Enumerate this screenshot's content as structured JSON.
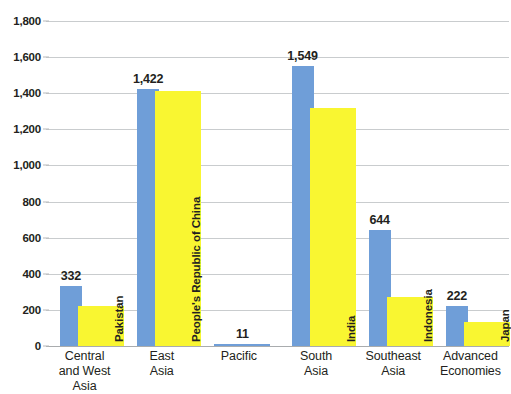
{
  "chart_data": {
    "type": "bar",
    "title": "",
    "subtitle": "",
    "xlabel": "",
    "ylabel": "",
    "ylim": [
      0,
      1800
    ],
    "ytick_step": 200,
    "ytick_labels": [
      "1,800",
      "1,600",
      "1,400",
      "1,200",
      "1,000",
      "800",
      "600",
      "400",
      "200",
      "0"
    ],
    "ytick_values": [
      1800,
      1600,
      1400,
      1200,
      1000,
      800,
      600,
      400,
      200,
      0
    ],
    "grid": true,
    "legend": "none",
    "bar_style": "overlapped",
    "categories": [
      "Central and West Asia",
      "East Asia",
      "Pacific",
      "South Asia",
      "Southeast Asia",
      "Advanced Economies"
    ],
    "category_label_lines": [
      [
        "Central",
        "and West",
        "Asia"
      ],
      [
        "East",
        "Asia"
      ],
      [
        "Pacific"
      ],
      [
        "South",
        "Asia"
      ],
      [
        "Southeast",
        "Asia"
      ],
      [
        "Advanced",
        "Economies"
      ]
    ],
    "series": [
      {
        "name": "Region total",
        "color": "#6f9ed8",
        "values": [
          332,
          1422,
          11,
          1549,
          644,
          222
        ],
        "value_labels": [
          "332",
          "1,422",
          "11",
          "1,549",
          "644",
          "222"
        ]
      },
      {
        "name": "Largest economy",
        "color": "#f9f631",
        "values": [
          220,
          1412,
          0,
          1320,
          270,
          135
        ],
        "point_labels": [
          "Pakistan",
          "People's Republic of China",
          "",
          "India",
          "Indonesia",
          "Japan"
        ]
      }
    ]
  },
  "axis": {
    "y_ticks": [
      {
        "label": "1,800",
        "value": 1800
      },
      {
        "label": "1,600",
        "value": 1600
      },
      {
        "label": "1,400",
        "value": 1400
      },
      {
        "label": "1,200",
        "value": 1200
      },
      {
        "label": "1,000",
        "value": 1000
      },
      {
        "label": "800",
        "value": 800
      },
      {
        "label": "600",
        "value": 600
      },
      {
        "label": "400",
        "value": 400
      },
      {
        "label": "200",
        "value": 200
      },
      {
        "label": "0",
        "value": 0
      }
    ]
  }
}
